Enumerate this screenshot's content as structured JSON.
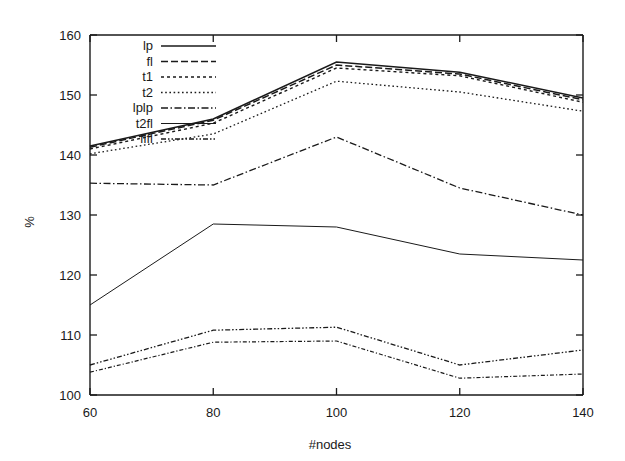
{
  "chart_data": {
    "type": "line",
    "title": "",
    "xlabel": "#nodes",
    "ylabel": "%",
    "x": [
      60,
      80,
      100,
      120,
      140
    ],
    "xlim": [
      60,
      140
    ],
    "ylim": [
      100,
      160
    ],
    "xticks": [
      "60",
      "80",
      "100",
      "120",
      "140"
    ],
    "yticks": [
      "100",
      "110",
      "120",
      "130",
      "140",
      "150",
      "160"
    ],
    "grid": false,
    "legend_position": "top-left",
    "series": [
      {
        "name": "lp",
        "values": [
          141.5,
          146.0,
          155.5,
          153.8,
          149.5
        ],
        "dash": "none"
      },
      {
        "name": "fl",
        "values": [
          141.3,
          145.8,
          155.0,
          153.5,
          149.2
        ],
        "dash": "dash"
      },
      {
        "name": "t1",
        "values": [
          141.0,
          145.3,
          154.5,
          153.2,
          148.8
        ],
        "dash": "dot-med"
      },
      {
        "name": "t2",
        "values": [
          140.2,
          143.5,
          152.3,
          150.5,
          147.3
        ],
        "dash": "dot-fine"
      },
      {
        "name": "lplp",
        "values": [
          135.3,
          135.0,
          143.0,
          134.5,
          130.0
        ],
        "dash": "dashdot"
      },
      {
        "name": "t2fl",
        "values": [
          115.0,
          128.5,
          128.0,
          123.5,
          122.5
        ],
        "dash": "solid-thin"
      },
      {
        "name": "flfl",
        "values": [
          105.0,
          110.8,
          111.3,
          105.0,
          107.5
        ],
        "dash": "dashdotdot"
      }
    ],
    "series_extra": [
      {
        "name": "flfl-b",
        "values": [
          103.8,
          108.8,
          109.0,
          102.8,
          103.5
        ],
        "dash": "dashdot-fine"
      }
    ],
    "axis_color": "#1a1a1a",
    "line_color": "#1a1a1a",
    "background": "#ffffff"
  },
  "legend": {
    "entries": [
      "lp",
      "fl",
      "t1",
      "t2",
      "lplp",
      "t2fl",
      "flfl"
    ]
  },
  "axes": {
    "x_title": "#nodes",
    "y_title": "%"
  }
}
